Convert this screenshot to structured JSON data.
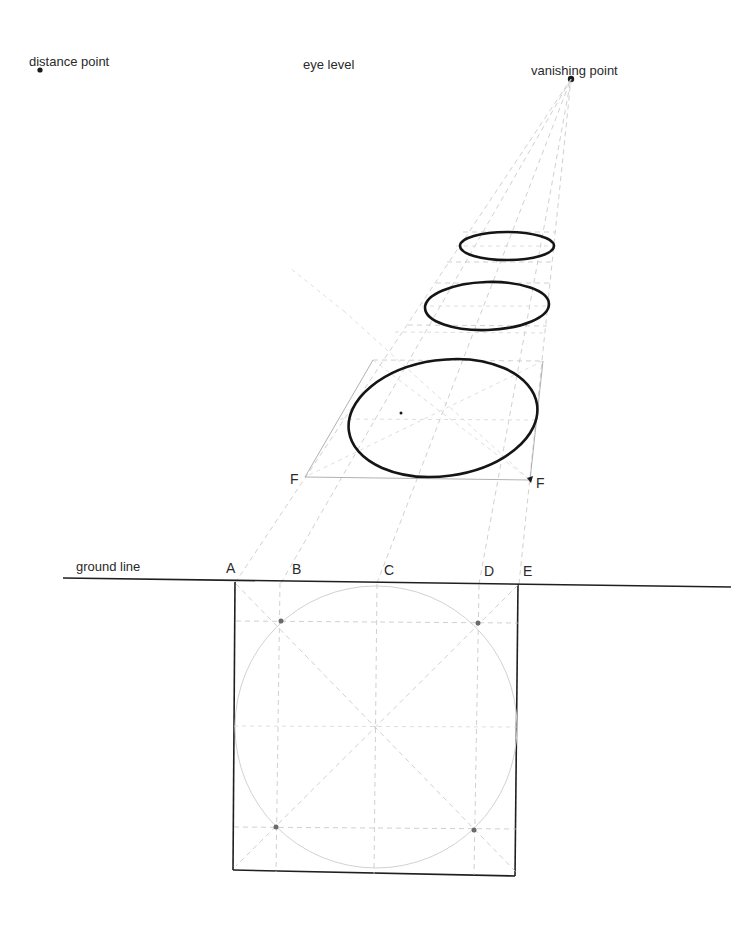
{
  "diagram": {
    "title_labels": {
      "distance_point": "distance point",
      "eye_level": "eye level",
      "vanishing_point": "vanishing point",
      "ground_line": "ground line"
    },
    "ground_points": {
      "A": "A",
      "B": "B",
      "C": "C",
      "D": "D",
      "E": "E"
    },
    "front_edge_points": {
      "F_left": "F",
      "F_right": "F"
    },
    "elements": {
      "vanishing_point": {
        "x": 571,
        "y": 79
      },
      "distance_point": {
        "x": 40,
        "y": 70
      },
      "ground_line_y": 584,
      "plan_square": {
        "x1": 235,
        "y1": 582,
        "x2": 518,
        "y2": 876
      },
      "ellipses": [
        {
          "name": "near",
          "cx": 443,
          "cy": 418,
          "rx": 95,
          "ry": 58
        },
        {
          "name": "middle",
          "cx": 487,
          "cy": 306,
          "rx": 62,
          "ry": 24
        },
        {
          "name": "far",
          "cx": 507,
          "cy": 246,
          "rx": 47,
          "ry": 14
        }
      ]
    },
    "colors": {
      "ink": "#151515",
      "guide": "#c4c4c4",
      "paper": "#ffffff"
    }
  }
}
